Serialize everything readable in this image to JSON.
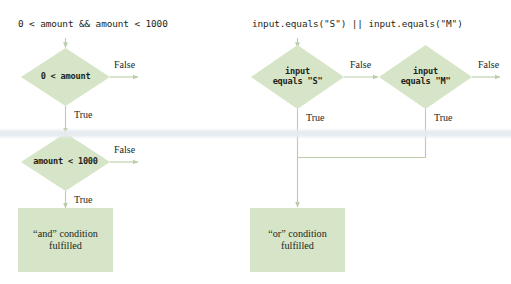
{
  "figure": {
    "colors": {
      "node_fill": "#d6e5c7",
      "node_fill_alt": "#d9e7cb",
      "connector": "#b9cdaa",
      "text": "#231f20",
      "background": "#ffffff"
    }
  },
  "charts": [
    {
      "id": "and-chart",
      "header": "0 < amount && amount < 1000",
      "decisions": [
        {
          "id": "d1",
          "label": "0 < amount",
          "false_label": "False",
          "true_label": "True"
        },
        {
          "id": "d2",
          "label": "amount < 1000",
          "false_label": "False",
          "true_label": "True"
        }
      ],
      "terminal": {
        "id": "and-box",
        "line1": "“and” condition",
        "line2": "fulfilled"
      }
    },
    {
      "id": "or-chart",
      "header": "input.equals(\"S\") || input.equals(\"M\")",
      "decisions": [
        {
          "id": "d3",
          "label": "input\nequals \"S\"",
          "false_label": "False",
          "true_label": "True"
        },
        {
          "id": "d4",
          "label": "input\nequals \"M\"",
          "false_label": "False",
          "true_label": "True"
        }
      ],
      "terminal": {
        "id": "or-box",
        "line1": "“or” condition",
        "line2": "fulfilled"
      }
    }
  ]
}
